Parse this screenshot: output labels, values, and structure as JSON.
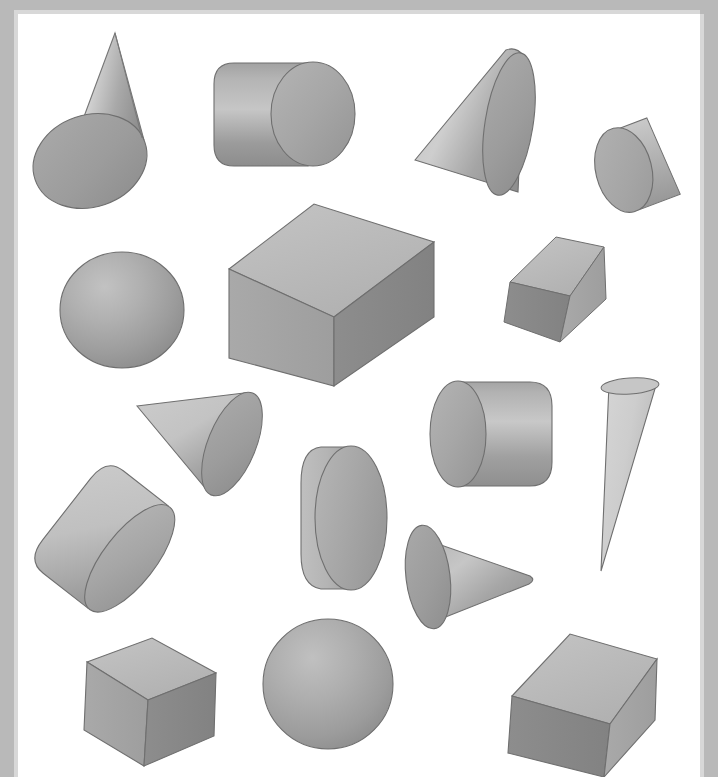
{
  "figure": {
    "background_color": "#ffffff",
    "frame_color": "#b9b9b9",
    "frame_highlight_color": "#d8d8d8",
    "outline_color": "#6f6f6f",
    "canvas": {
      "x": 18,
      "y": 14,
      "width": 682,
      "height": 763
    },
    "shape_count": 17
  },
  "palette": {
    "light": "#d2d2d2",
    "mid_light": "#bdbdbd",
    "mid": "#a8a8a8",
    "mid_dark": "#949494",
    "dark": "#808080",
    "darker": "#6e6e6e",
    "outline": "#6f6f6f"
  },
  "shapes": [
    {
      "id": "cone-1",
      "name": "cone",
      "label": "Cone (apex up, tilted, large base ellipse)",
      "type": "cone",
      "position": {
        "x": 26,
        "y": 33
      },
      "size": {
        "width": 130,
        "height": 180
      },
      "orientation": "apex up-right, base lower-left",
      "shading": "light on upper-left face, mid gray base"
    },
    {
      "id": "cylinder-1",
      "name": "cylinder",
      "label": "Cylinder (horizontal, cap at right)",
      "type": "cylinder",
      "position": {
        "x": 196,
        "y": 62
      },
      "size": {
        "width": 155,
        "height": 105
      },
      "orientation": "axis horizontal, right end cap visible",
      "shading": "gradient dark at bottom-left to light at top"
    },
    {
      "id": "cone-2",
      "name": "cone",
      "label": "Cone (pointing left, base ellipse at right)",
      "type": "cone",
      "position": {
        "x": 415,
        "y": 37
      },
      "size": {
        "width": 130,
        "height": 155
      },
      "orientation": "apex pointing left, base facing right",
      "shading": "light band across middle"
    },
    {
      "id": "disc-1",
      "name": "disc",
      "label": "Thin disc / short cylinder (tilted)",
      "type": "cylinder",
      "position": {
        "x": 608,
        "y": 110
      },
      "size": {
        "width": 76,
        "height": 96
      },
      "orientation": "flat face toward viewer, tilted right",
      "shading": "flat mid gray face, lighter rim"
    },
    {
      "id": "sphere-1",
      "name": "sphere",
      "label": "Sphere (upper left)",
      "type": "sphere",
      "position": {
        "x": 58,
        "y": 252
      },
      "size": {
        "width": 126,
        "height": 116
      },
      "orientation": "none",
      "shading": "radial highlight upper-left"
    },
    {
      "id": "cube-1",
      "name": "cube",
      "label": "Large cube (center, three faces visible)",
      "type": "cube",
      "position": {
        "x": 228,
        "y": 201
      },
      "size": {
        "width": 206,
        "height": 185
      },
      "orientation": "standard isometric, top face lit",
      "shading": "top light, left mid, right dark"
    },
    {
      "id": "cube-2",
      "name": "cube",
      "label": "Small rotated cube (right of large cube)",
      "type": "cube",
      "position": {
        "x": 510,
        "y": 230
      },
      "size": {
        "width": 100,
        "height": 103
      },
      "orientation": "rotated, tilted toward viewer",
      "shading": "top light, left dark, right mid"
    },
    {
      "id": "cone-3",
      "name": "cone",
      "label": "Cone (small, pointing up-left)",
      "type": "cone",
      "position": {
        "x": 137,
        "y": 392
      },
      "size": {
        "width": 110,
        "height": 105
      },
      "orientation": "apex upper-left, base lower-right",
      "shading": "light along upper edge"
    },
    {
      "id": "cylinder-2",
      "name": "cylinder",
      "label": "Cylinder (horizontal, cap at left)",
      "type": "cylinder",
      "position": {
        "x": 427,
        "y": 365
      },
      "size": {
        "width": 133,
        "height": 115
      },
      "orientation": "axis horizontal, left end cap visible",
      "shading": "light band, darker at bottom"
    },
    {
      "id": "cone-4",
      "name": "cone",
      "label": "Narrow cone (inverted, apex down)",
      "type": "cone",
      "position": {
        "x": 595,
        "y": 372
      },
      "size": {
        "width": 62,
        "height": 205
      },
      "orientation": "apex pointing down, base ellipse at top",
      "shading": "very light overall"
    },
    {
      "id": "cylinder-3",
      "name": "cylinder",
      "label": "Cylinder (near face-on, vertical axis)",
      "type": "cylinder",
      "position": {
        "x": 283,
        "y": 430
      },
      "size": {
        "width": 88,
        "height": 148
      },
      "orientation": "viewed nearly along axis, round face toward viewer",
      "shading": "flat mid face, lighter sliver at left"
    },
    {
      "id": "cylinder-4",
      "name": "cylinder",
      "label": "Cylinder (tilted, cap at lower right)",
      "type": "cylinder",
      "position": {
        "x": 30,
        "y": 477
      },
      "size": {
        "width": 135,
        "height": 125
      },
      "orientation": "tilted diagonally, cap facing lower-right",
      "shading": "light on upper body, mid cap"
    },
    {
      "id": "cone-5",
      "name": "cone",
      "label": "Cone (pointing right, base at left)",
      "type": "cone",
      "position": {
        "x": 412,
        "y": 512
      },
      "size": {
        "width": 122,
        "height": 105
      },
      "orientation": "apex pointing right, base ellipse on left",
      "shading": "light band through center"
    },
    {
      "id": "cube-3",
      "name": "cube",
      "label": "Cube (lower left)",
      "type": "cube",
      "position": {
        "x": 82,
        "y": 629
      },
      "size": {
        "width": 130,
        "height": 120
      },
      "orientation": "isometric, top face lit",
      "shading": "top light, left mid, right dark"
    },
    {
      "id": "sphere-2",
      "name": "sphere",
      "label": "Sphere (bottom center)",
      "type": "sphere",
      "position": {
        "x": 263,
        "y": 618
      },
      "size": {
        "width": 130,
        "height": 130
      },
      "orientation": "none",
      "shading": "radial highlight upper-left"
    },
    {
      "id": "cube-4",
      "name": "cube",
      "label": "Cube (lower right)",
      "type": "cube",
      "position": {
        "x": 508,
        "y": 617
      },
      "size": {
        "width": 145,
        "height": 135
      },
      "orientation": "isometric, tilted, top face lit",
      "shading": "top light, left dark, right mid"
    },
    {
      "id": "cylinder-5",
      "name": "cylinder",
      "label": "Partial cylinder edge (overlap reference)",
      "type": "cylinder",
      "position": {
        "x": 0,
        "y": 0
      },
      "size": {
        "width": 0,
        "height": 0
      },
      "orientation": "hidden",
      "shading": "none"
    }
  ]
}
